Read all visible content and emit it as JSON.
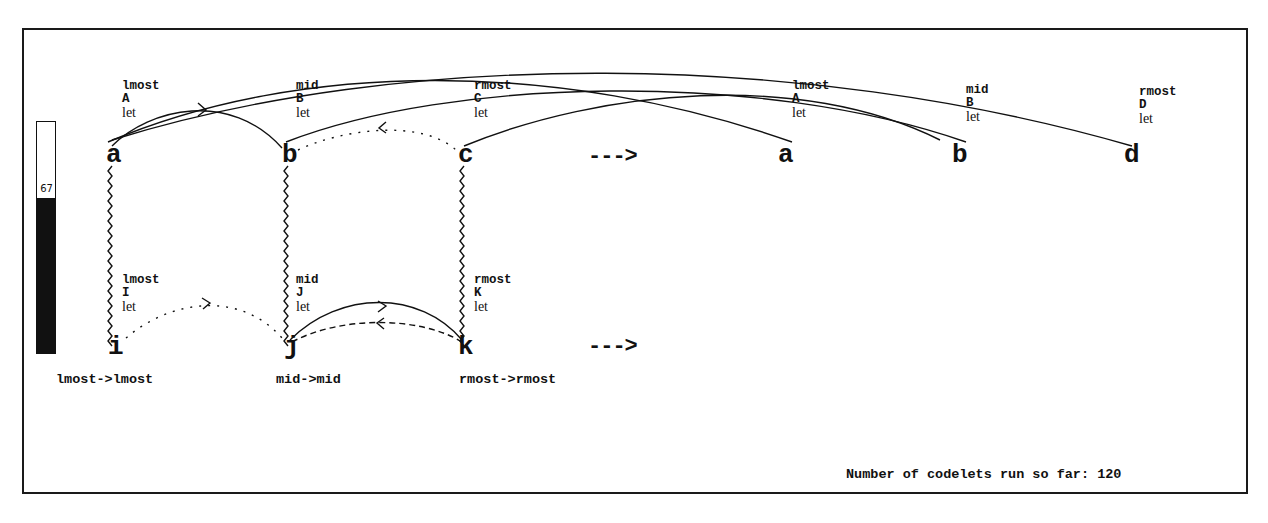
{
  "temperature": {
    "value": "67",
    "percent": 67
  },
  "initial_string": [
    {
      "letter": "a",
      "desc": [
        "lmost",
        "A",
        "let"
      ]
    },
    {
      "letter": "b",
      "desc": [
        "mid",
        "B",
        "let"
      ]
    },
    {
      "letter": "c",
      "desc": [
        "rmost",
        "C",
        "let"
      ]
    }
  ],
  "modified_string": [
    {
      "letter": "a",
      "desc": [
        "lmost",
        "A",
        "let"
      ]
    },
    {
      "letter": "b",
      "desc": [
        "mid",
        "B",
        "let"
      ]
    },
    {
      "letter": "d",
      "desc": [
        "rmost",
        "D",
        "let"
      ]
    }
  ],
  "target_string": [
    {
      "letter": "i",
      "desc": [
        "lmost",
        "I",
        "let"
      ]
    },
    {
      "letter": "j",
      "desc": [
        "mid",
        "J",
        "let"
      ]
    },
    {
      "letter": "k",
      "desc": [
        "rmost",
        "K",
        "let"
      ]
    }
  ],
  "arrows": {
    "top": "--->",
    "bottom": "--->"
  },
  "correspondences": [
    "lmost->lmost",
    "mid->mid",
    "rmost->rmost"
  ],
  "status": {
    "label": "Number of codelets run so far:",
    "count": "120"
  }
}
